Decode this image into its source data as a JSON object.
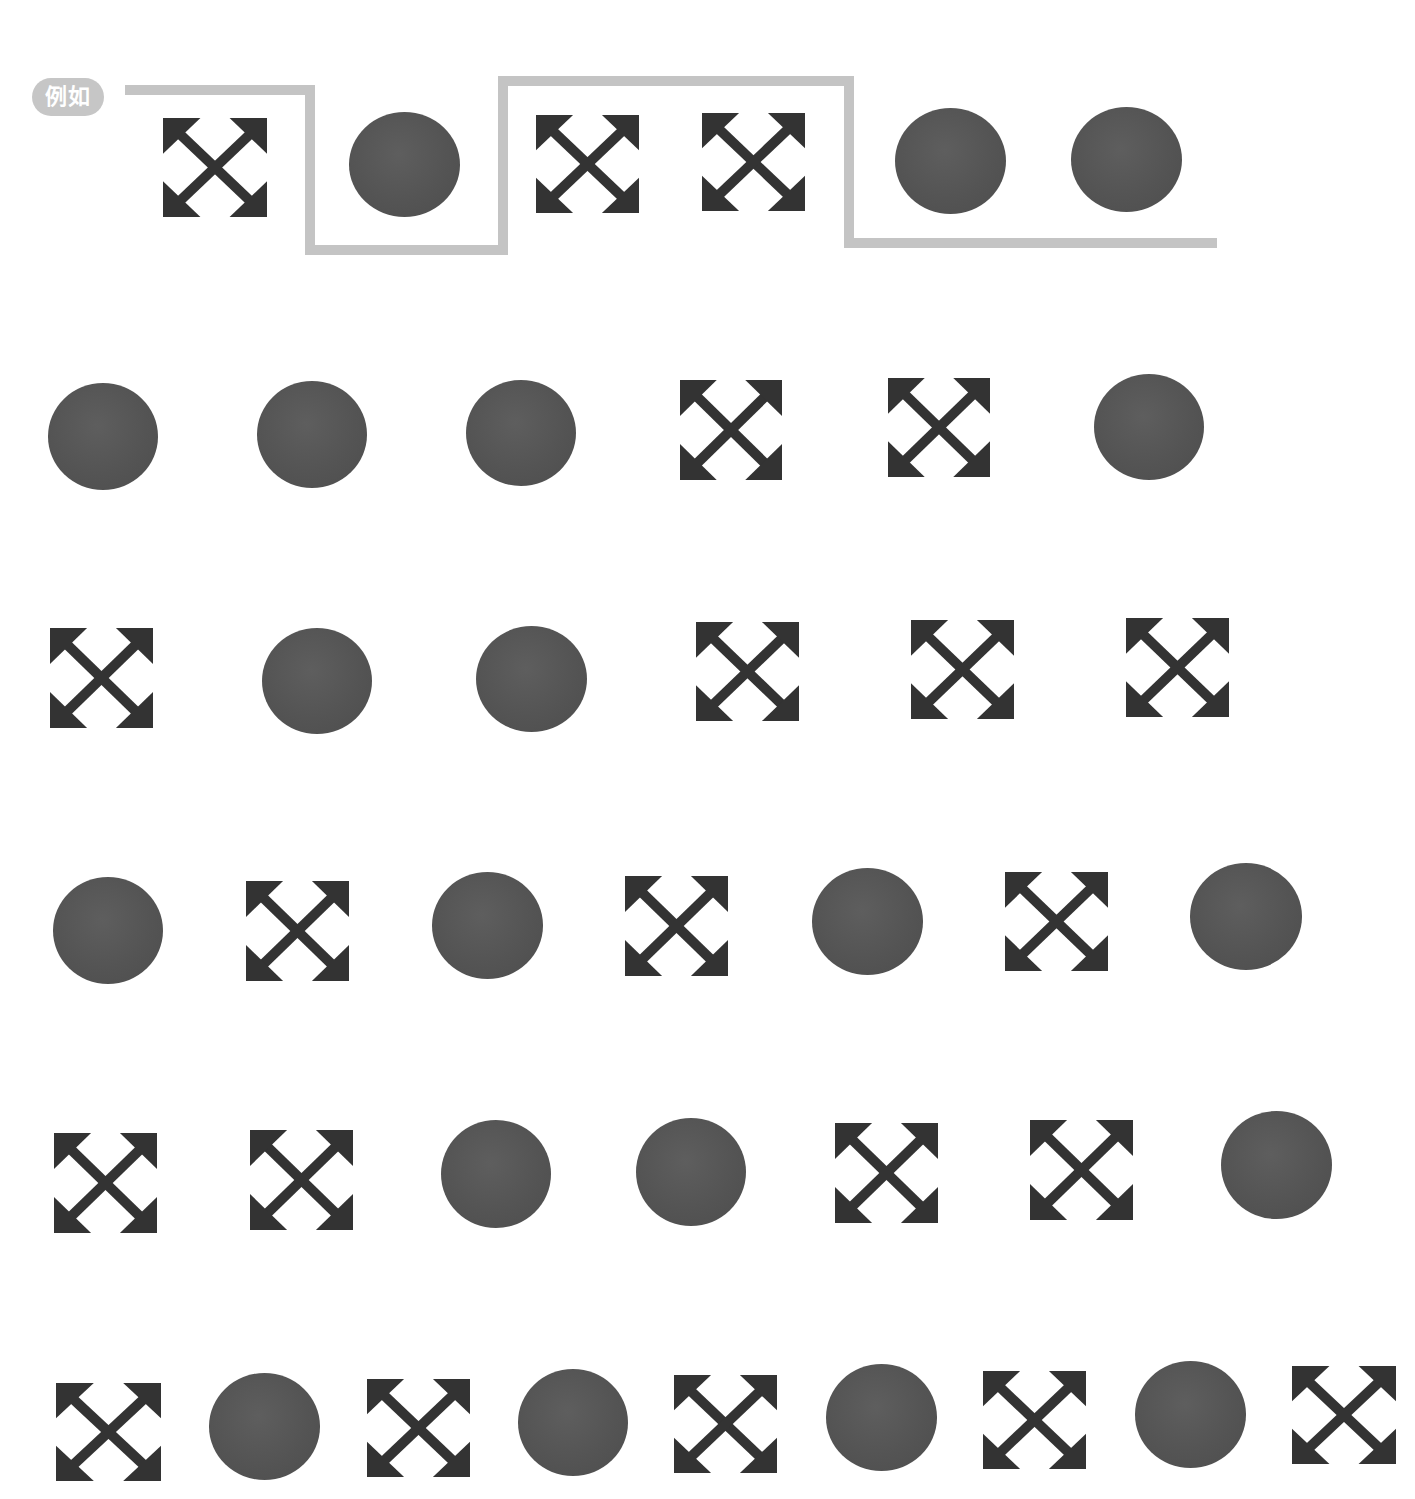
{
  "label": {
    "text": "例如",
    "bg_color": "#c6c6c6",
    "text_color": "#ffffff"
  },
  "colors": {
    "shape_fill": "#333333",
    "circle_fill": "#555555",
    "path_stroke": "#c4c4c4"
  },
  "example_path": {
    "stroke_width": 10,
    "points": [
      [
        125,
        90
      ],
      [
        310,
        90
      ],
      [
        310,
        250
      ],
      [
        503,
        250
      ],
      [
        503,
        81
      ],
      [
        849,
        81
      ],
      [
        849,
        243
      ],
      [
        1217,
        243
      ]
    ]
  },
  "rows": [
    {
      "name": "example-row",
      "shapes": [
        {
          "type": "arrows",
          "x": 163,
          "y": 118,
          "w": 104,
          "h": 99
        },
        {
          "type": "circle",
          "x": 349,
          "y": 112,
          "w": 111,
          "h": 105
        },
        {
          "type": "arrows",
          "x": 536,
          "y": 115,
          "w": 103,
          "h": 98
        },
        {
          "type": "arrows",
          "x": 702,
          "y": 113,
          "w": 103,
          "h": 98
        },
        {
          "type": "circle",
          "x": 895,
          "y": 108,
          "w": 111,
          "h": 106
        },
        {
          "type": "circle",
          "x": 1071,
          "y": 107,
          "w": 111,
          "h": 105
        }
      ]
    },
    {
      "name": "row-2",
      "shapes": [
        {
          "type": "circle",
          "x": 48,
          "y": 383,
          "w": 110,
          "h": 107
        },
        {
          "type": "circle",
          "x": 257,
          "y": 381,
          "w": 110,
          "h": 107
        },
        {
          "type": "circle",
          "x": 466,
          "y": 380,
          "w": 110,
          "h": 106
        },
        {
          "type": "arrows",
          "x": 680,
          "y": 380,
          "w": 102,
          "h": 100
        },
        {
          "type": "arrows",
          "x": 888,
          "y": 378,
          "w": 102,
          "h": 99
        },
        {
          "type": "circle",
          "x": 1094,
          "y": 374,
          "w": 110,
          "h": 106
        }
      ]
    },
    {
      "name": "row-3",
      "shapes": [
        {
          "type": "arrows",
          "x": 50,
          "y": 628,
          "w": 103,
          "h": 100
        },
        {
          "type": "circle",
          "x": 262,
          "y": 628,
          "w": 110,
          "h": 106
        },
        {
          "type": "circle",
          "x": 476,
          "y": 626,
          "w": 111,
          "h": 106
        },
        {
          "type": "arrows",
          "x": 696,
          "y": 622,
          "w": 103,
          "h": 99
        },
        {
          "type": "arrows",
          "x": 911,
          "y": 620,
          "w": 103,
          "h": 99
        },
        {
          "type": "arrows",
          "x": 1126,
          "y": 618,
          "w": 103,
          "h": 99
        }
      ]
    },
    {
      "name": "row-4",
      "shapes": [
        {
          "type": "circle",
          "x": 53,
          "y": 877,
          "w": 110,
          "h": 107
        },
        {
          "type": "arrows",
          "x": 246,
          "y": 881,
          "w": 103,
          "h": 100
        },
        {
          "type": "circle",
          "x": 432,
          "y": 872,
          "w": 111,
          "h": 107
        },
        {
          "type": "arrows",
          "x": 625,
          "y": 876,
          "w": 103,
          "h": 100
        },
        {
          "type": "circle",
          "x": 812,
          "y": 868,
          "w": 111,
          "h": 107
        },
        {
          "type": "arrows",
          "x": 1005,
          "y": 872,
          "w": 103,
          "h": 99
        },
        {
          "type": "circle",
          "x": 1190,
          "y": 863,
          "w": 112,
          "h": 107
        }
      ]
    },
    {
      "name": "row-5",
      "shapes": [
        {
          "type": "arrows",
          "x": 54,
          "y": 1133,
          "w": 103,
          "h": 100
        },
        {
          "type": "arrows",
          "x": 250,
          "y": 1130,
          "w": 103,
          "h": 100
        },
        {
          "type": "circle",
          "x": 441,
          "y": 1120,
          "w": 110,
          "h": 108
        },
        {
          "type": "circle",
          "x": 636,
          "y": 1118,
          "w": 110,
          "h": 108
        },
        {
          "type": "arrows",
          "x": 835,
          "y": 1123,
          "w": 103,
          "h": 100
        },
        {
          "type": "arrows",
          "x": 1030,
          "y": 1120,
          "w": 103,
          "h": 100
        },
        {
          "type": "circle",
          "x": 1221,
          "y": 1111,
          "w": 111,
          "h": 108
        }
      ]
    },
    {
      "name": "row-6",
      "shapes": [
        {
          "type": "arrows",
          "x": 56,
          "y": 1383,
          "w": 105,
          "h": 98
        },
        {
          "type": "circle",
          "x": 209,
          "y": 1373,
          "w": 111,
          "h": 107
        },
        {
          "type": "arrows",
          "x": 367,
          "y": 1379,
          "w": 103,
          "h": 98
        },
        {
          "type": "circle",
          "x": 518,
          "y": 1369,
          "w": 110,
          "h": 107
        },
        {
          "type": "arrows",
          "x": 674,
          "y": 1375,
          "w": 103,
          "h": 98
        },
        {
          "type": "circle",
          "x": 826,
          "y": 1364,
          "w": 111,
          "h": 107
        },
        {
          "type": "arrows",
          "x": 983,
          "y": 1371,
          "w": 103,
          "h": 98
        },
        {
          "type": "circle",
          "x": 1135,
          "y": 1361,
          "w": 111,
          "h": 107
        },
        {
          "type": "arrows",
          "x": 1292,
          "y": 1366,
          "w": 104,
          "h": 98
        }
      ]
    }
  ]
}
